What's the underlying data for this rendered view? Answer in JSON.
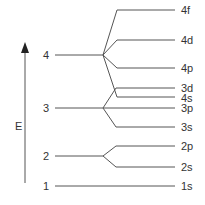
{
  "diagram": {
    "axis_label": "E",
    "shell_labels": [
      "4",
      "3",
      "2",
      "1"
    ],
    "orbital_labels": [
      "4f",
      "4d",
      "4p",
      "3d",
      "4s",
      "3p",
      "3s",
      "2p",
      "2s",
      "1s"
    ],
    "line_color": "#555555"
  }
}
